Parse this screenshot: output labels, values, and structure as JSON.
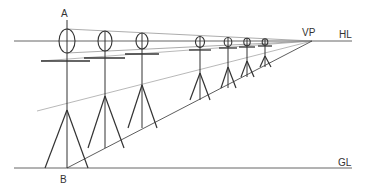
{
  "labels": {
    "point_a": "A",
    "point_b": "B",
    "vanishing_point": "VP",
    "horizon_line": "HL",
    "ground_line": "GL"
  },
  "colors": {
    "figure_stroke": "#333333",
    "guide_stroke": "#888888",
    "line_stroke": "#666666"
  },
  "geometry": {
    "horizon_y": 41,
    "ground_y": 168,
    "vanishing_point": [
      312,
      41
    ],
    "line_x_start": 14,
    "line_x_end": 352
  },
  "figures": [
    {
      "x": 67,
      "head_cy": 41,
      "head_rx": 8,
      "head_ry": 12,
      "arm_y": 61,
      "arm_l": 41,
      "arm_r": 90,
      "hip_y": 110,
      "foot_y": 168,
      "foot_l": 45,
      "foot_r": 88
    },
    {
      "x": 105,
      "head_cy": 41,
      "head_rx": 7,
      "head_ry": 10,
      "arm_y": 58,
      "arm_l": 84,
      "arm_r": 125,
      "hip_y": 96,
      "foot_y": 148,
      "foot_l": 88,
      "foot_r": 124
    },
    {
      "x": 142,
      "head_cy": 41,
      "head_rx": 6,
      "head_ry": 8,
      "arm_y": 54,
      "arm_l": 125,
      "arm_r": 159,
      "hip_y": 85,
      "foot_y": 128,
      "foot_l": 128,
      "foot_r": 157
    },
    {
      "x": 200,
      "head_cy": 42,
      "head_rx": 4.5,
      "head_ry": 5.5,
      "arm_y": 50,
      "arm_l": 189,
      "arm_r": 211,
      "hip_y": 73,
      "foot_y": 100,
      "foot_l": 190,
      "foot_r": 210
    },
    {
      "x": 228,
      "head_cy": 42,
      "head_rx": 3.8,
      "head_ry": 4.5,
      "arm_y": 48,
      "arm_l": 219,
      "arm_r": 237,
      "hip_y": 67,
      "foot_y": 88,
      "foot_l": 221,
      "foot_r": 236
    },
    {
      "x": 247,
      "head_cy": 42,
      "head_rx": 3.2,
      "head_ry": 3.8,
      "arm_y": 47,
      "arm_l": 239,
      "arm_r": 255,
      "hip_y": 61,
      "foot_y": 77,
      "foot_l": 241,
      "foot_r": 254
    },
    {
      "x": 265,
      "head_cy": 42,
      "head_rx": 2.8,
      "head_ry": 3.2,
      "arm_y": 46,
      "arm_l": 258,
      "arm_r": 272,
      "hip_y": 56,
      "foot_y": 67,
      "foot_l": 260,
      "foot_r": 271
    }
  ]
}
